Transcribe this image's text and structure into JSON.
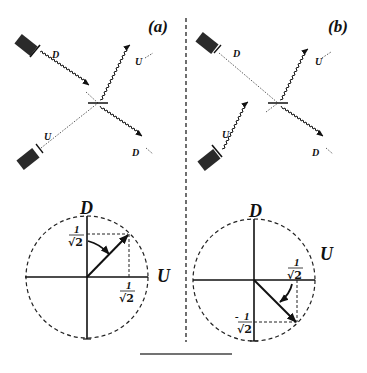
{
  "panels": {
    "a": {
      "label": "(a)",
      "top": {
        "source_d_label": "D",
        "out_u_label": "U",
        "source_u_label": "U",
        "out_d_label": "D"
      },
      "bottom": {
        "axis_v_label": "D",
        "axis_h_label": "U",
        "tick_v": {
          "num": "1",
          "den": "√2"
        },
        "tick_h": {
          "num": "1",
          "den": "√2"
        }
      }
    },
    "b": {
      "label": "(b)",
      "top": {
        "source_d_label": "D",
        "out_u_label": "U",
        "source_u_label": "U",
        "out_d_label": "D"
      },
      "bottom": {
        "axis_v_label": "D",
        "axis_h_label": "U",
        "tick_h": {
          "num": "1",
          "den": "√2"
        },
        "tick_v": {
          "sign": "-",
          "num": "1",
          "den": "√2"
        }
      }
    }
  },
  "colors": {
    "ink": "#111111",
    "source_fill": "#2a2a2a",
    "background": "#ffffff"
  }
}
